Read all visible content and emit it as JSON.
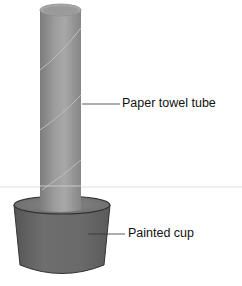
{
  "labels": {
    "tube": "Paper towel tube",
    "cup": "Painted cup"
  },
  "colors": {
    "tube_body": "#8f8f8f",
    "tube_light": "#b3b3b3",
    "tube_dark": "#6f6f6f",
    "tube_top": "#a6a6a6",
    "cup_body": "#6a6a6a",
    "cup_dark": "#4a4a4a",
    "cup_rim": "#7a7a7a",
    "leader_line": "#333333"
  }
}
